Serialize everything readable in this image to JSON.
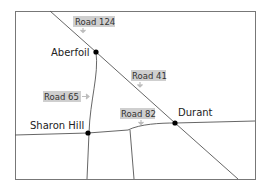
{
  "map": {
    "towns": [
      {
        "name": "Aberfoil",
        "x": 96,
        "y": 52
      },
      {
        "name": "Sharon Hill",
        "x": 88,
        "y": 133
      },
      {
        "name": "Durant",
        "x": 175,
        "y": 123
      }
    ],
    "roads": [
      {
        "label": "Road 124"
      },
      {
        "label": "Road 41"
      },
      {
        "label": "Road 65"
      },
      {
        "label": "Road 82"
      }
    ],
    "colors": {
      "road": "#555555",
      "frame": "#777777",
      "label_bg": "#cfcfcf",
      "town_dot": "#000000"
    }
  }
}
